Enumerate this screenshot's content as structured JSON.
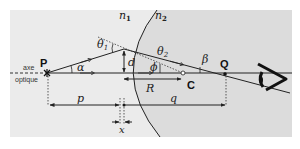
{
  "diagram": {
    "labels": {
      "n1": "n",
      "n1_sub": "1",
      "n2": "n",
      "n2_sub": "2",
      "theta1": "θ",
      "theta1_sub": "1",
      "theta2": "θ",
      "theta2_sub": "2",
      "alpha": "α",
      "beta": "β",
      "phi": "ϕ",
      "d": "d",
      "R": "R",
      "p": "p",
      "q": "q",
      "x": "x",
      "P": "P",
      "Q": "Q",
      "C": "C",
      "axis_line1": "axe",
      "axis_line2": "optique"
    },
    "colors": {
      "background_outer": "#ffffff",
      "medium1": "#ebebeb",
      "medium2": "#dcdcdc",
      "lines": "#222222"
    }
  }
}
